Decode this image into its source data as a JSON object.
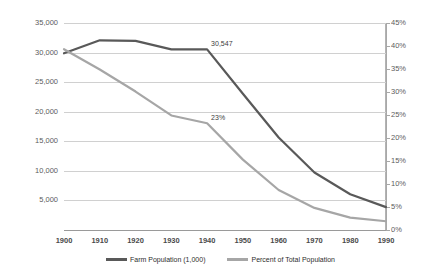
{
  "chart_data": {
    "type": "line",
    "title": "",
    "subtitle": "",
    "xlabel": "",
    "ylabel": "",
    "y2label": "",
    "grid": true,
    "legend_position": "bottom",
    "categories": [
      "1900",
      "1910",
      "1920",
      "1930",
      "1940",
      "1950",
      "1960",
      "1970",
      "1980",
      "1990"
    ],
    "x": [
      1900,
      1910,
      1920,
      1930,
      1940,
      1950,
      1960,
      1970,
      1980,
      1990
    ],
    "axes": {
      "left": {
        "min": 0,
        "max": 35000,
        "step": 5000,
        "ticks": [
          "0",
          "5,000",
          "10,000",
          "15,000",
          "20,000",
          "25,000",
          "30,000",
          "35,000"
        ]
      },
      "right": {
        "min": 0,
        "max": 45,
        "step": 5,
        "ticks": [
          "0%",
          "5%",
          "10%",
          "15%",
          "20%",
          "25%",
          "30%",
          "35%",
          "40%",
          "45%"
        ]
      },
      "x": {
        "ticks": [
          "1900",
          "1910",
          "1920",
          "1930",
          "1940",
          "1950",
          "1960",
          "1970",
          "1980",
          "1990"
        ]
      }
    },
    "series": [
      {
        "name": "Farm Population (1,000)",
        "axis": "left",
        "color": "#595959",
        "values": [
          29875,
          32077,
          31974,
          30529,
          30547,
          23048,
          15635,
          9712,
          6051,
          3871
        ]
      },
      {
        "name": "Percent of Total Population",
        "axis": "right",
        "color": "#a6a6a6",
        "values": [
          39.3,
          34.9,
          30.1,
          24.9,
          23.2,
          15.3,
          8.7,
          4.8,
          2.7,
          1.9
        ]
      }
    ],
    "annotations": [
      {
        "text": "30,547",
        "series": "Farm Population (1,000)",
        "x": 1940,
        "value": 30547
      },
      {
        "text": "23%",
        "series": "Percent of Total Population",
        "x": 1940,
        "value": 23.2
      }
    ],
    "legend": [
      {
        "label": "Farm Population (1,000)",
        "color": "#595959"
      },
      {
        "label": "Percent of Total Population",
        "color": "#a6a6a6"
      }
    ]
  }
}
